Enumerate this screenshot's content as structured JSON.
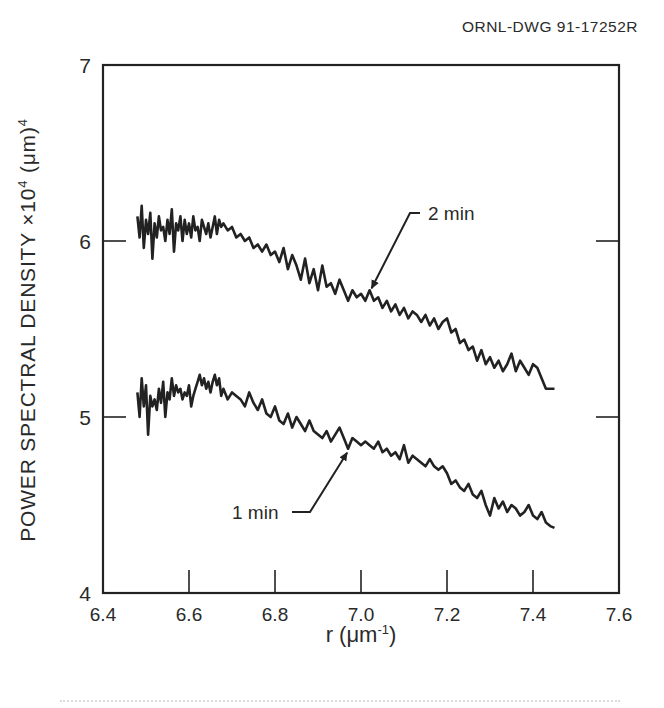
{
  "drawing_id": "ORNL-DWG 91-17252R",
  "chart_data": {
    "type": "line",
    "title": "",
    "xlabel": "r (μm⁻¹)",
    "xlabel_parts": {
      "main": "r (μm",
      "sup": "-1",
      "close": ")"
    },
    "ylabel": "POWER SPECTRAL DENSITY ×10⁴ (μm)⁴",
    "ylabel_parts": {
      "pre": "POWER SPECTRAL DENSITY ×10",
      "sup1": "4",
      "mid": " (μm)",
      "sup2": "4"
    },
    "xlim": [
      6.4,
      7.6
    ],
    "ylim": [
      4,
      7
    ],
    "xticks": [
      "6.4",
      "6.6",
      "6.8",
      "7.0",
      "7.2",
      "7.4",
      "7.6"
    ],
    "yticks": [
      "4",
      "5",
      "6",
      "7"
    ],
    "grid": false,
    "legend": "inline annotations with arrows",
    "annotations": [
      {
        "text": "2 min",
        "points_to": [
          7.02,
          5.72
        ]
      },
      {
        "text": "1 min",
        "points_to": [
          6.97,
          4.82
        ]
      }
    ],
    "series": [
      {
        "name": "2 min",
        "x": [
          6.48,
          6.485,
          6.49,
          6.495,
          6.5,
          6.505,
          6.51,
          6.515,
          6.52,
          6.525,
          6.53,
          6.535,
          6.54,
          6.545,
          6.55,
          6.555,
          6.56,
          6.565,
          6.57,
          6.575,
          6.58,
          6.585,
          6.59,
          6.595,
          6.6,
          6.605,
          6.61,
          6.615,
          6.62,
          6.625,
          6.63,
          6.635,
          6.64,
          6.645,
          6.65,
          6.655,
          6.66,
          6.665,
          6.67,
          6.675,
          6.68,
          6.69,
          6.7,
          6.71,
          6.72,
          6.73,
          6.74,
          6.75,
          6.76,
          6.77,
          6.78,
          6.79,
          6.8,
          6.81,
          6.82,
          6.83,
          6.84,
          6.85,
          6.86,
          6.87,
          6.88,
          6.89,
          6.9,
          6.91,
          6.92,
          6.93,
          6.94,
          6.95,
          6.96,
          6.97,
          6.98,
          6.99,
          7.0,
          7.01,
          7.02,
          7.03,
          7.04,
          7.05,
          7.06,
          7.07,
          7.08,
          7.09,
          7.1,
          7.11,
          7.12,
          7.13,
          7.14,
          7.15,
          7.16,
          7.17,
          7.18,
          7.19,
          7.2,
          7.21,
          7.22,
          7.23,
          7.24,
          7.25,
          7.26,
          7.27,
          7.28,
          7.29,
          7.3,
          7.31,
          7.32,
          7.33,
          7.34,
          7.35,
          7.36,
          7.37,
          7.38,
          7.39,
          7.4,
          7.41,
          7.42,
          7.43,
          7.44,
          7.45
        ],
        "y": [
          6.14,
          6.02,
          6.2,
          5.96,
          6.12,
          6.04,
          6.16,
          5.9,
          6.1,
          6.02,
          6.14,
          6.06,
          6.08,
          6.0,
          6.12,
          6.04,
          6.18,
          5.94,
          6.1,
          6.06,
          6.14,
          6.0,
          6.12,
          6.04,
          6.1,
          6.02,
          6.14,
          6.06,
          6.08,
          6.0,
          6.12,
          6.08,
          6.04,
          6.1,
          6.02,
          6.08,
          6.14,
          6.04,
          6.12,
          6.08,
          6.1,
          6.06,
          6.08,
          6.02,
          6.04,
          6.0,
          6.02,
          5.96,
          5.98,
          5.94,
          5.98,
          5.92,
          5.94,
          5.88,
          5.96,
          5.84,
          5.92,
          5.86,
          5.78,
          5.9,
          5.76,
          5.84,
          5.72,
          5.86,
          5.74,
          5.76,
          5.7,
          5.78,
          5.72,
          5.66,
          5.72,
          5.68,
          5.7,
          5.66,
          5.72,
          5.66,
          5.68,
          5.62,
          5.66,
          5.6,
          5.64,
          5.58,
          5.62,
          5.56,
          5.6,
          5.58,
          5.54,
          5.58,
          5.52,
          5.56,
          5.5,
          5.54,
          5.56,
          5.48,
          5.5,
          5.42,
          5.44,
          5.38,
          5.4,
          5.32,
          5.38,
          5.3,
          5.34,
          5.28,
          5.32,
          5.26,
          5.3,
          5.36,
          5.26,
          5.32,
          5.28,
          5.24,
          5.3,
          5.28,
          5.22,
          5.16,
          5.16,
          5.16
        ]
      },
      {
        "name": "1 min",
        "x": [
          6.48,
          6.485,
          6.49,
          6.495,
          6.5,
          6.505,
          6.51,
          6.515,
          6.52,
          6.525,
          6.53,
          6.535,
          6.54,
          6.545,
          6.55,
          6.555,
          6.56,
          6.565,
          6.57,
          6.575,
          6.58,
          6.585,
          6.59,
          6.595,
          6.6,
          6.605,
          6.61,
          6.615,
          6.62,
          6.625,
          6.63,
          6.635,
          6.64,
          6.645,
          6.65,
          6.655,
          6.66,
          6.665,
          6.67,
          6.675,
          6.68,
          6.69,
          6.7,
          6.71,
          6.72,
          6.73,
          6.74,
          6.75,
          6.76,
          6.77,
          6.78,
          6.79,
          6.8,
          6.81,
          6.82,
          6.83,
          6.84,
          6.85,
          6.86,
          6.87,
          6.88,
          6.89,
          6.9,
          6.91,
          6.92,
          6.93,
          6.94,
          6.95,
          6.96,
          6.97,
          6.98,
          6.99,
          7.0,
          7.01,
          7.02,
          7.03,
          7.04,
          7.05,
          7.06,
          7.07,
          7.08,
          7.09,
          7.1,
          7.11,
          7.12,
          7.13,
          7.14,
          7.15,
          7.16,
          7.17,
          7.18,
          7.19,
          7.2,
          7.21,
          7.22,
          7.23,
          7.24,
          7.25,
          7.26,
          7.27,
          7.28,
          7.29,
          7.3,
          7.31,
          7.32,
          7.33,
          7.34,
          7.35,
          7.36,
          7.37,
          7.38,
          7.39,
          7.4,
          7.41,
          7.42,
          7.43,
          7.44,
          7.45
        ],
        "y": [
          5.14,
          5.0,
          5.22,
          5.06,
          5.18,
          4.9,
          5.12,
          5.06,
          5.1,
          5.04,
          5.16,
          5.08,
          5.2,
          5.0,
          5.14,
          5.1,
          5.22,
          5.12,
          5.18,
          5.14,
          5.16,
          5.1,
          5.14,
          5.12,
          5.18,
          5.06,
          5.12,
          5.16,
          5.2,
          5.24,
          5.18,
          5.22,
          5.16,
          5.2,
          5.14,
          5.2,
          5.24,
          5.18,
          5.22,
          5.12,
          5.16,
          5.1,
          5.14,
          5.12,
          5.1,
          5.06,
          5.14,
          5.08,
          5.04,
          5.1,
          5.02,
          5.0,
          5.06,
          4.98,
          4.96,
          5.02,
          4.94,
          5.0,
          4.96,
          4.92,
          4.98,
          4.92,
          4.9,
          4.88,
          4.92,
          4.86,
          4.9,
          4.94,
          4.88,
          4.82,
          4.88,
          4.86,
          4.84,
          4.86,
          4.84,
          4.82,
          4.86,
          4.8,
          4.82,
          4.78,
          4.8,
          4.76,
          4.84,
          4.74,
          4.78,
          4.76,
          4.74,
          4.72,
          4.76,
          4.72,
          4.7,
          4.72,
          4.68,
          4.62,
          4.64,
          4.6,
          4.58,
          4.62,
          4.56,
          4.54,
          4.58,
          4.5,
          4.44,
          4.54,
          4.48,
          4.52,
          4.46,
          4.5,
          4.48,
          4.44,
          4.46,
          4.5,
          4.44,
          4.42,
          4.46,
          4.4,
          4.38,
          4.37
        ]
      }
    ]
  },
  "layout": {
    "plot_left": 103,
    "plot_top": 65,
    "plot_right": 619,
    "plot_bottom": 593,
    "ink_color": "#222222",
    "background": "#ffffff"
  }
}
